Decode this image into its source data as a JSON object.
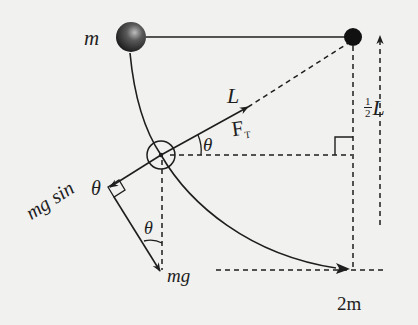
{
  "diagram": {
    "type": "pendulum-free-body",
    "colors": {
      "background": "#f1f1ef",
      "ink": "#1e1e1e"
    },
    "labels": {
      "mass_top": "m",
      "length": "L",
      "tension": "F",
      "tension_sub": "T",
      "theta_top": "θ",
      "half_length_num": "1",
      "half_length_den": "2",
      "half_length_var": "L",
      "tangential_prefix": "mg sin",
      "tangential_theta": "θ",
      "theta_lower": "θ",
      "weight": "mg",
      "mass_bottom": "2m"
    },
    "elements": {
      "mass_ball": "shaded sphere, mass m, at left end of horizontal string",
      "pivot": "black filled dot at top right",
      "string": "horizontal solid line between ball and pivot",
      "swing_path": "curved arrow from ball through pendulum position to lowest point",
      "pendulum_position": "small circle marking bob at angle theta",
      "tension_vector": "solid arrow along string toward pivot",
      "weight_vector": "solid arrow mg",
      "tangential_vector": "solid arrow mg sin theta",
      "half_length_arrow": "dashed upward arrow",
      "right_angles": 2
    }
  }
}
